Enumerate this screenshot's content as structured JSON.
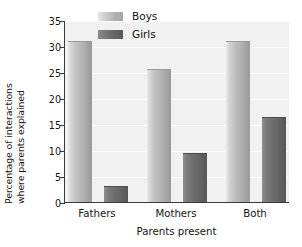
{
  "chart_data": {
    "type": "bar",
    "title": "",
    "xlabel": "Parents present",
    "ylabel_line1": "Percentage of interactions",
    "ylabel_line2": "where parents explained",
    "categories": [
      "Fathers",
      "Mothers",
      "Both"
    ],
    "series": [
      {
        "name": "Boys",
        "values": [
          31.0,
          25.5,
          31.0
        ],
        "color": "#b5b5b5"
      },
      {
        "name": "Girls",
        "values": [
          3.0,
          9.4,
          16.4
        ],
        "color": "#6a6a6a"
      }
    ],
    "ylim": [
      0,
      35
    ],
    "yticks": [
      0,
      5,
      10,
      15,
      20,
      25,
      30,
      35
    ],
    "ytick_labels": [
      "0",
      "5",
      "10",
      "15",
      "20",
      "25",
      "30",
      "35"
    ],
    "grid": true,
    "legend_position": "top-center",
    "plot_background": "#f1f1f1",
    "axis_color": "#3a3a3a"
  },
  "legend": {
    "entries": [
      {
        "label": "Boys"
      },
      {
        "label": "Girls"
      }
    ]
  }
}
